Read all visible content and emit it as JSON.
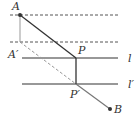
{
  "diagram": {
    "labels": {
      "A": "A",
      "A_prime": "A′",
      "P": "P",
      "P_prime": "P′",
      "B": "B",
      "l": "l",
      "l_prime": "l′"
    },
    "points": {
      "A": [
        20,
        15
      ],
      "A_prime": [
        20,
        42
      ],
      "P": [
        76,
        58
      ],
      "P_prime": [
        76,
        84
      ],
      "B": [
        110,
        109
      ]
    },
    "lines": {
      "dashed_top_y": 15,
      "dashed_mid_y": 42,
      "l_y": 58,
      "l_prime_y": 84
    },
    "colors": {
      "stroke": "#333333",
      "light_stroke": "#999999"
    }
  }
}
